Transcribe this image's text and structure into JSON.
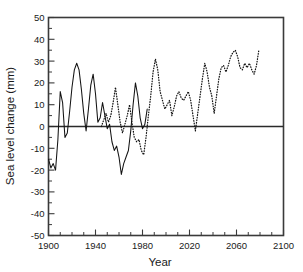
{
  "chart_data": {
    "type": "line",
    "title": "",
    "xlabel": "Year",
    "ylabel": "Sea level change (mm)",
    "xlim": [
      1900,
      2100
    ],
    "ylim": [
      -50,
      50
    ],
    "grid": false,
    "legend_position": "none",
    "x_ticks": [
      1900,
      1940,
      1980,
      2020,
      2060,
      2100
    ],
    "x_tick_labels": [
      "1900",
      "1940",
      "1980",
      "2020",
      "2060",
      "2100"
    ],
    "x_minor_tick_interval": 10,
    "y_ticks": [
      -50,
      -40,
      -30,
      -20,
      -10,
      0,
      10,
      20,
      30,
      40,
      50
    ],
    "y_tick_labels": [
      "-50",
      "-40",
      "-30",
      "-20",
      "-10",
      "0",
      "10",
      "20",
      "30",
      "40",
      "50"
    ],
    "y_minor_tick_interval": 5,
    "zero_reference_line": 0,
    "series": [
      {
        "name": "Observed sea level change",
        "style": "solid",
        "color": "#141414",
        "x": [
          1900,
          1902,
          1904,
          1906,
          1908,
          1910,
          1912,
          1914,
          1916,
          1918,
          1920,
          1922,
          1924,
          1926,
          1928,
          1930,
          1932,
          1934,
          1936,
          1938,
          1940,
          1942,
          1944,
          1946,
          1948,
          1950,
          1952,
          1954,
          1956,
          1958,
          1960,
          1962,
          1964,
          1966,
          1968,
          1970,
          1972,
          1974,
          1976,
          1978,
          1980,
          1982,
          1984
        ],
        "values": [
          -15,
          -19,
          -17,
          -20,
          -6,
          16,
          11,
          -5,
          -3,
          7,
          18,
          26,
          29,
          26,
          17,
          6,
          -2,
          8,
          19,
          24,
          15,
          2,
          4,
          11,
          5,
          -1,
          1,
          -7,
          -11,
          -9,
          -14,
          -22,
          -17,
          -14,
          -11,
          -2,
          10,
          20,
          14,
          4,
          -1,
          1,
          8
        ]
      },
      {
        "name": "Projected sea level change",
        "style": "dotted",
        "color": "#141414",
        "x": [
          1945,
          1947,
          1949,
          1951,
          1953,
          1955,
          1957,
          1959,
          1961,
          1963,
          1965,
          1967,
          1969,
          1971,
          1973,
          1975,
          1977,
          1979,
          1981,
          1983,
          1985,
          1987,
          1989,
          1991,
          1993,
          1995,
          1997,
          1999,
          2001,
          2003,
          2005,
          2007,
          2009,
          2011,
          2013,
          2015,
          2017,
          2019,
          2021,
          2023,
          2025,
          2027,
          2029,
          2031,
          2033,
          2035,
          2037,
          2039,
          2041,
          2043,
          2045,
          2047,
          2049,
          2051,
          2053,
          2055,
          2057,
          2059,
          2061,
          2063,
          2065,
          2067,
          2069,
          2071,
          2073,
          2075,
          2077,
          2079
        ],
        "values": [
          0,
          3,
          6,
          2,
          5,
          11,
          18,
          10,
          2,
          -3,
          1,
          5,
          10,
          2,
          -5,
          -7,
          -6,
          -11,
          -13,
          -5,
          5,
          14,
          25,
          31,
          26,
          16,
          12,
          8,
          10,
          12,
          5,
          9,
          14,
          16,
          13,
          12,
          14,
          16,
          12,
          5,
          -2,
          6,
          14,
          22,
          29,
          25,
          18,
          14,
          6,
          14,
          22,
          27,
          28,
          25,
          28,
          32,
          34,
          35,
          32,
          27,
          26,
          29,
          27,
          29,
          26,
          24,
          28,
          35
        ]
      }
    ]
  },
  "axes": {
    "x_axis_title": "Year",
    "y_axis_title": "Sea level change (mm)"
  }
}
